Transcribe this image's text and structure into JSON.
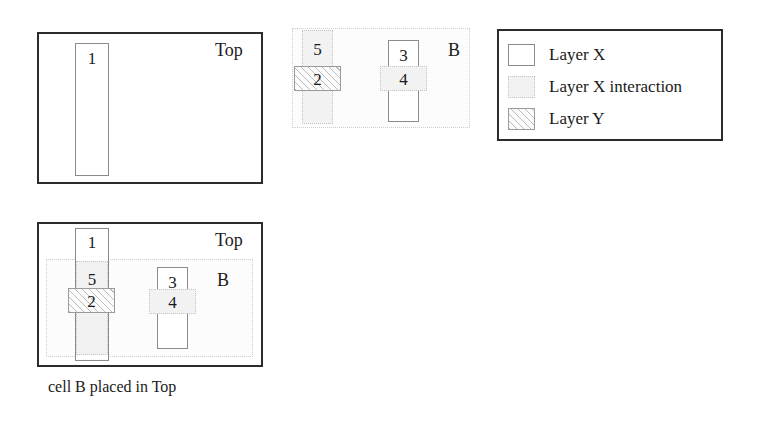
{
  "figure": {
    "caption": "cell B placed in Top"
  },
  "panels": {
    "top_cell_alone": {
      "corner_label": "Top",
      "shapes": [
        {
          "id": "rect-1",
          "label": "1",
          "layer": "Layer X"
        }
      ]
    },
    "cell_b_alone": {
      "corner_label": "B",
      "shapes": [
        {
          "id": "rect-5",
          "label": "5",
          "layer": "Layer X interaction"
        },
        {
          "id": "rect-2",
          "label": "2",
          "layer": "Layer Y"
        },
        {
          "id": "rect-3",
          "label": "3",
          "layer": "Layer X"
        },
        {
          "id": "rect-4",
          "label": "4",
          "layer": "Layer X interaction"
        }
      ]
    },
    "merged": {
      "corner_label_top": "Top",
      "corner_label_b": "B",
      "shapes": [
        {
          "id": "rect-1",
          "label": "1",
          "layer": "Layer X"
        },
        {
          "id": "rect-5",
          "label": "5",
          "layer": "Layer X interaction"
        },
        {
          "id": "rect-2",
          "label": "2",
          "layer": "Layer Y"
        },
        {
          "id": "rect-3",
          "label": "3",
          "layer": "Layer X"
        },
        {
          "id": "rect-4",
          "label": "4",
          "layer": "Layer X interaction"
        }
      ]
    }
  },
  "legend": {
    "items": [
      {
        "swatch": "layer-x-swatch",
        "label": "Layer X"
      },
      {
        "swatch": "layer-x-interaction-swatch",
        "label": "Layer X interaction"
      },
      {
        "swatch": "layer-y-swatch",
        "label": "Layer Y"
      }
    ]
  },
  "colors": {
    "outline_strong": "#2b2b2b",
    "outline_thin": "#8c8c8c",
    "interaction_fill": "#f2f2f2",
    "interaction_border": "#c4c4c4",
    "hatch_line": "#bdbdbd",
    "background": "#ffffff"
  }
}
